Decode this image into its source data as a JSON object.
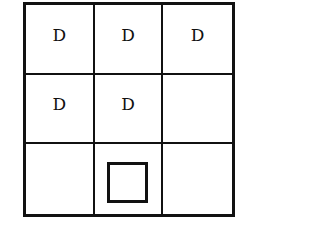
{
  "grid": {
    "rows": 3,
    "cols": 3,
    "cells": [
      [
        "D",
        "D",
        "D"
      ],
      [
        "D",
        "D",
        ""
      ],
      [
        "",
        "",
        ""
      ]
    ],
    "marker": {
      "row": 2,
      "col": 1,
      "shape": "square"
    }
  }
}
